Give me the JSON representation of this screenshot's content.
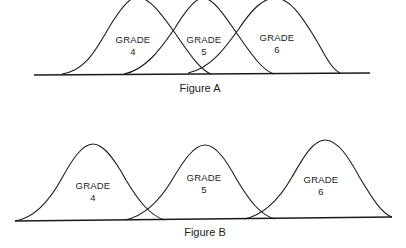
{
  "figures": [
    {
      "caption": "Figure A",
      "description": "Overlapping grade distributions",
      "curves": [
        {
          "line1": "GRADE",
          "line2": "4"
        },
        {
          "line1": "GRADE",
          "line2": "5"
        },
        {
          "line1": "GRADE",
          "line2": "6"
        }
      ]
    },
    {
      "caption": "Figure B",
      "description": "Grade distributions with little overlap",
      "curves": [
        {
          "line1": "GRADE",
          "line2": "4"
        },
        {
          "line1": "GRADE",
          "line2": "5"
        },
        {
          "line1": "GRADE",
          "line2": "6"
        }
      ]
    }
  ]
}
